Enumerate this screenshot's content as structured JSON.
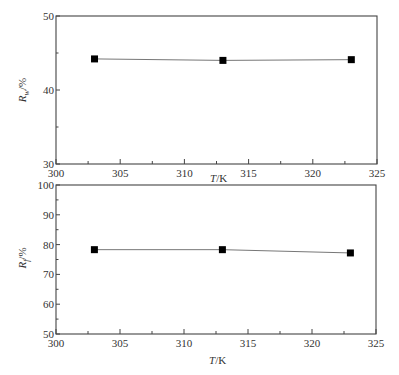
{
  "chart_data": [
    {
      "type": "line",
      "title": "",
      "xlabel": "T/K",
      "ylabel": "R_w/%",
      "ylabel_main": "R",
      "ylabel_sub": "w",
      "ylabel_unit": "/%",
      "x": [
        303,
        313,
        323
      ],
      "series": [
        {
          "name": "R_w",
          "values": [
            44.2,
            44.0,
            44.1
          ],
          "marker": "square",
          "color": "#000000"
        }
      ],
      "xlim": [
        300,
        325
      ],
      "ylim": [
        30,
        50
      ],
      "xticks": [
        300,
        305,
        310,
        315,
        320,
        325
      ],
      "yticks": [
        30,
        40,
        50
      ],
      "grid": false,
      "legend": null
    },
    {
      "type": "line",
      "title": "",
      "xlabel": "T/K",
      "ylabel": "R_f/%",
      "ylabel_main": "R",
      "ylabel_sub": "f",
      "ylabel_unit": "/%",
      "x": [
        303,
        313,
        323
      ],
      "series": [
        {
          "name": "R_f",
          "values": [
            78.3,
            78.3,
            77.2
          ],
          "marker": "square",
          "color": "#000000"
        }
      ],
      "xlim": [
        300,
        325
      ],
      "ylim": [
        50,
        100
      ],
      "xticks": [
        300,
        305,
        310,
        315,
        320,
        325
      ],
      "yticks": [
        50,
        60,
        70,
        80,
        90,
        100
      ],
      "grid": false,
      "legend": null
    }
  ],
  "labels": {
    "top_x_title_main": "T",
    "top_x_title_unit": "/K",
    "bottom_x_title_main": "T",
    "bottom_x_title_unit": "/K",
    "top_y_main": "R",
    "top_y_sub": "w",
    "top_y_unit": "/%",
    "bottom_y_main": "R",
    "bottom_y_sub": "f",
    "bottom_y_unit": "/%"
  }
}
